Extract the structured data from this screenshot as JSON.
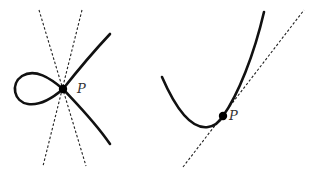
{
  "figures": [
    {
      "id": "node-singularity",
      "point_label": "P",
      "point": [
        63,
        89
      ],
      "tangent_lines": [
        {
          "from": [
            39,
            10
          ],
          "to": [
            86,
            166
          ]
        },
        {
          "from": [
            82,
            10
          ],
          "to": [
            43,
            166
          ]
        }
      ],
      "label_pos": [
        78,
        93
      ]
    },
    {
      "id": "smooth-point-tangent",
      "point_label": "P",
      "point": [
        223,
        116
      ],
      "tangent_lines": [
        {
          "from": [
            183,
            167
          ],
          "to": [
            304,
            10
          ]
        }
      ],
      "label_pos": [
        229,
        120
      ]
    }
  ],
  "colors": {
    "curve": "#111111",
    "tangent": "#222222",
    "label": "#333333",
    "background": "#ffffff"
  }
}
